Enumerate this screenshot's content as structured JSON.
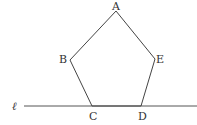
{
  "diagram": {
    "type": "geometry",
    "line": {
      "label": "ℓ",
      "x1": 24,
      "y1": 106,
      "x2": 197,
      "y2": 106
    },
    "vertices": [
      {
        "label": "A",
        "x": 116,
        "y": 11
      },
      {
        "label": "B",
        "x": 70,
        "y": 60
      },
      {
        "label": "C",
        "x": 92,
        "y": 106
      },
      {
        "label": "D",
        "x": 141,
        "y": 106
      },
      {
        "label": "E",
        "x": 155,
        "y": 59
      }
    ],
    "stroke_color": "#444444"
  }
}
